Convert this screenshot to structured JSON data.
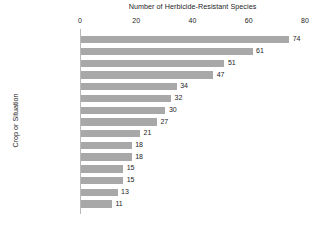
{
  "chart_data": {
    "type": "bar",
    "orientation": "horizontal",
    "title": "Number of Herbicide-Resistant Species",
    "xlabel": "Number of Herbicide-Resistant Species",
    "ylabel": "Crop or Situation",
    "xlim": [
      0,
      80
    ],
    "xticks": [
      0,
      20,
      40,
      60,
      80
    ],
    "xtick_labels": [
      "0",
      "20",
      "40",
      "60",
      "80"
    ],
    "grid": false,
    "legend": false,
    "show_data_labels": true,
    "bar_color": "#a8a8a8",
    "axis_color": "#b9b9b9",
    "text_color": "#1d1d1d",
    "categories": [
      "Wheat",
      "Corn (maize)",
      "Rice",
      "Soybean",
      "Roadsides",
      "Winter wheat",
      "Spring Barley",
      "Orchards",
      "Canola",
      "Cotton",
      "Pastures",
      "Railways",
      "Vegetables",
      "Peas",
      "Grapes"
    ],
    "values": [
      74,
      61,
      51,
      47,
      34,
      32,
      30,
      27,
      21,
      18,
      18,
      15,
      15,
      13,
      11
    ],
    "value_labels": [
      "74",
      "61",
      "51",
      "47",
      "34",
      "32",
      "30",
      "27",
      "21",
      "18",
      "18",
      "15",
      "15",
      "13",
      "11"
    ]
  }
}
